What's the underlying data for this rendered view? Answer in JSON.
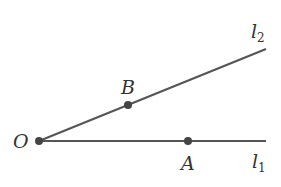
{
  "diagram": {
    "type": "geometry-angle",
    "colors": {
      "line": "#555555",
      "point": "#444444",
      "text": "#333333",
      "background": "#ffffff"
    },
    "points": [
      {
        "id": "O",
        "label": "O",
        "x": 39,
        "y": 141
      },
      {
        "id": "B",
        "label": "B",
        "x": 128,
        "y": 105
      },
      {
        "id": "A",
        "label": "A",
        "x": 188,
        "y": 141
      }
    ],
    "rays": [
      {
        "id": "l1",
        "label": "l",
        "subscript": "1",
        "from": "O",
        "end_x": 266,
        "end_y": 141
      },
      {
        "id": "l2",
        "label": "l",
        "subscript": "2",
        "from": "O",
        "end_x": 266,
        "end_y": 49
      }
    ],
    "labels": {
      "O": "O",
      "A": "A",
      "B": "B",
      "l1_main": "l",
      "l1_sub": "1",
      "l2_main": "l",
      "l2_sub": "2"
    }
  }
}
